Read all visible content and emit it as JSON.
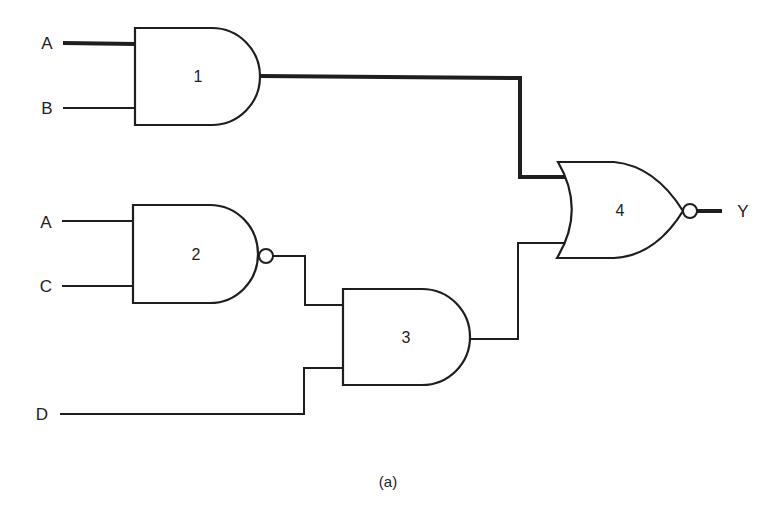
{
  "diagram": {
    "type": "logic-circuit",
    "caption": "(a)",
    "inputs": [
      {
        "id": "in-a1",
        "label": "A",
        "to_gate": "1"
      },
      {
        "id": "in-b",
        "label": "B",
        "to_gate": "1"
      },
      {
        "id": "in-a2",
        "label": "A",
        "to_gate": "2"
      },
      {
        "id": "in-c",
        "label": "C",
        "to_gate": "2"
      },
      {
        "id": "in-d",
        "label": "D",
        "to_gate": "3"
      }
    ],
    "output": {
      "label": "Y",
      "from_gate": "4"
    },
    "gates": [
      {
        "number": "1",
        "type": "AND",
        "inputs": [
          "A",
          "B"
        ]
      },
      {
        "number": "2",
        "type": "NAND",
        "inputs": [
          "A",
          "C"
        ]
      },
      {
        "number": "3",
        "type": "AND",
        "inputs": [
          "gate 2 output",
          "D"
        ]
      },
      {
        "number": "4",
        "type": "NOR",
        "inputs": [
          "gate 1 output",
          "gate 3 output"
        ]
      }
    ],
    "highlighted_path": [
      "A",
      "gate 1",
      "gate 4",
      "Y"
    ]
  },
  "labels": {
    "a1": "A",
    "b": "B",
    "a2": "A",
    "c": "C",
    "d": "D",
    "y": "Y",
    "g1": "1",
    "g2": "2",
    "g3": "3",
    "g4": "4",
    "caption": "(a)"
  }
}
